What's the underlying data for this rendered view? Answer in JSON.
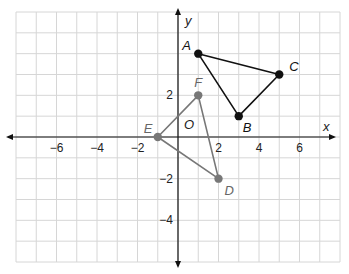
{
  "chart_data": {
    "type": "scatter",
    "title": "",
    "xlabel": "x",
    "ylabel": "y",
    "origin_label": "O",
    "xlim": [
      -8,
      8
    ],
    "ylim": [
      -6,
      6
    ],
    "grid": true,
    "x_ticks": [
      {
        "value": -6,
        "label": "−6"
      },
      {
        "value": -4,
        "label": "−4"
      },
      {
        "value": -2,
        "label": "−2"
      },
      {
        "value": 2,
        "label": "2"
      },
      {
        "value": 4,
        "label": "4"
      },
      {
        "value": 6,
        "label": "6"
      }
    ],
    "y_ticks": [
      {
        "value": 2,
        "label": "2"
      },
      {
        "value": -2,
        "label": "−2"
      },
      {
        "value": -4,
        "label": "−4"
      }
    ],
    "series": [
      {
        "name": "Triangle ABC",
        "color": "#111111",
        "points": [
          {
            "label": "A",
            "x": 1,
            "y": 4
          },
          {
            "label": "B",
            "x": 3,
            "y": 1
          },
          {
            "label": "C",
            "x": 5,
            "y": 3
          }
        ]
      },
      {
        "name": "Triangle DEF",
        "color": "#777777",
        "points": [
          {
            "label": "D",
            "x": 2,
            "y": -2
          },
          {
            "label": "E",
            "x": -1,
            "y": 0
          },
          {
            "label": "F",
            "x": 1,
            "y": 2
          }
        ]
      }
    ]
  },
  "colors": {
    "grid": "#d6d6d6",
    "axis": "#111111",
    "abc": "#111111",
    "def": "#7a7a7a"
  }
}
